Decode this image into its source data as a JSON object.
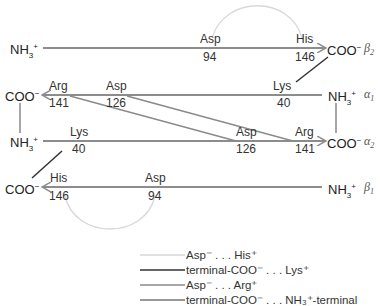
{
  "chains": {
    "beta2": {
      "name": "β",
      "sub": "2",
      "n_term": "NH3+",
      "c_term": "COO−"
    },
    "alpha1": {
      "name": "α",
      "sub": "1",
      "n_term": "NH3+",
      "c_term": "COO−"
    },
    "alpha2": {
      "name": "α",
      "sub": "2",
      "n_term": "NH3+",
      "c_term": "COO−"
    },
    "beta1": {
      "name": "β",
      "sub": "1",
      "n_term": "NH3+",
      "c_term": "COO−"
    }
  },
  "terminals": {
    "nh3": "NH",
    "nh3_sub": "3",
    "nh3_sup": "+",
    "coo": "COO",
    "coo_sup": "−"
  },
  "residues": {
    "beta2_asp": {
      "name": "Asp",
      "num": "94"
    },
    "beta2_his": {
      "name": "His",
      "num": "146"
    },
    "alpha1_arg": {
      "name": "Arg",
      "num": "141"
    },
    "alpha1_asp": {
      "name": "Asp",
      "num": "126"
    },
    "alpha1_lys": {
      "name": "Lys",
      "num": "40"
    },
    "alpha2_lys": {
      "name": "Lys",
      "num": "40"
    },
    "alpha2_asp": {
      "name": "Asp",
      "num": "126"
    },
    "alpha2_arg": {
      "name": "Arg",
      "num": "141"
    },
    "beta1_his": {
      "name": "His",
      "num": "146"
    },
    "beta1_asp": {
      "name": "Asp",
      "num": "94"
    }
  },
  "legend": [
    {
      "label": "Asp⁻ . . . His⁺",
      "color": "#d6d6d6"
    },
    {
      "label": "terminal-COO⁻ . . . Lys⁺",
      "color": "#333333"
    },
    {
      "label": "Asp⁻ . . . Arg⁺",
      "color": "#8a8a8a"
    },
    {
      "label": "terminal-COO⁻ . . . NH₃⁺-terminal",
      "color": "#777777"
    }
  ],
  "colors": {
    "chain_line": "#8c8c8c",
    "his_asp_arc": "#d8d8d8",
    "lys_link": "#333333",
    "arg_asp_link": "#8a8a8a",
    "terminal_link": "#777777"
  }
}
